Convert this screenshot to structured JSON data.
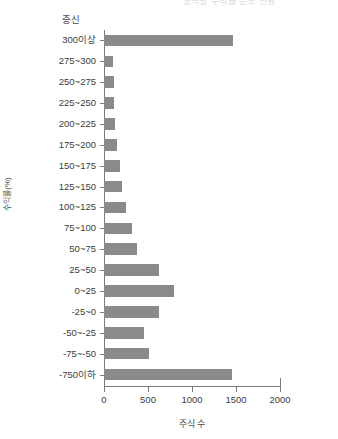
{
  "chart_data": {
    "type": "bar",
    "orientation": "horizontal",
    "title": "종목별 수익률 분포 현황",
    "xlabel": "주식 수",
    "ylabel": "수익률(%)",
    "category_header": "증신",
    "xlim": [
      0,
      2000
    ],
    "xticks": [
      0,
      500,
      1000,
      1500,
      2000
    ],
    "xticklabels": [
      "0",
      "500",
      "1000",
      "1500",
      "2000"
    ],
    "grid": false,
    "legend": null,
    "bar_color": "#8a8a8a",
    "axis_color": "#7b7b7b",
    "categories": [
      "300이상",
      "275~300",
      "250~275",
      "225~250",
      "200~225",
      "175~200",
      "150~175",
      "125~150",
      "100~125",
      "75~100",
      "50~75",
      "25~50",
      "0~25",
      "-25~0",
      "-50~-25",
      "-75~-50",
      "-750이하"
    ],
    "values": [
      1470,
      100,
      110,
      115,
      130,
      150,
      180,
      210,
      250,
      320,
      380,
      620,
      800,
      620,
      450,
      510,
      1450
    ]
  }
}
